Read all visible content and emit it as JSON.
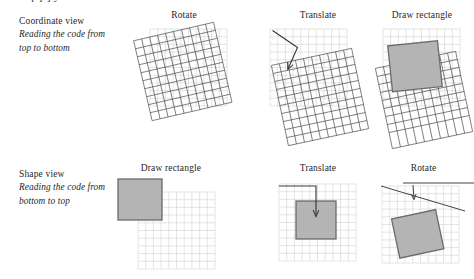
{
  "clipped_header_text": "a a  p p  j y          x",
  "palette": {
    "light_grid_line": "#d9d9d9",
    "dark_grid_line": "#4a4a4a",
    "rect_fill": "#b4b4b4",
    "rect_stroke": "#6b6b6b",
    "arrow_stroke": "#3a3a3a",
    "text": "#1f1f1f",
    "background": "#ffffff"
  },
  "rows": [
    {
      "id": "coordinate-view",
      "view": {
        "title": "Coordinate view",
        "subtitle_lines": [
          "Reading the code from",
          "top to bottom"
        ]
      },
      "panels": [
        {
          "id": "rotate-top",
          "title": "Rotate",
          "contents": [
            "light-grid",
            "rotated-dark-grid"
          ]
        },
        {
          "id": "translate-top",
          "title": "Translate",
          "contents": [
            "light-grid",
            "translate-arrow",
            "rotated-dark-grid"
          ]
        },
        {
          "id": "draw-top",
          "title": "Draw rectangle",
          "contents": [
            "light-grid",
            "gray-rectangle",
            "rotated-dark-grid"
          ]
        }
      ]
    },
    {
      "id": "shape-view",
      "view": {
        "title": "Shape view",
        "subtitle_lines": [
          "Reading the code from",
          "bottom to top"
        ]
      },
      "panels": [
        {
          "id": "draw-bottom",
          "title": "Draw rectangle",
          "contents": [
            "gray-rectangle",
            "light-grid"
          ]
        },
        {
          "id": "translate-bottom",
          "title": "Translate",
          "contents": [
            "light-grid",
            "gray-rectangle",
            "translate-arrow"
          ]
        },
        {
          "id": "rotate-bottom",
          "title": "Rotate",
          "contents": [
            "light-grid",
            "rotated-gray-rectangle",
            "rotation-arrow"
          ]
        }
      ]
    }
  ]
}
